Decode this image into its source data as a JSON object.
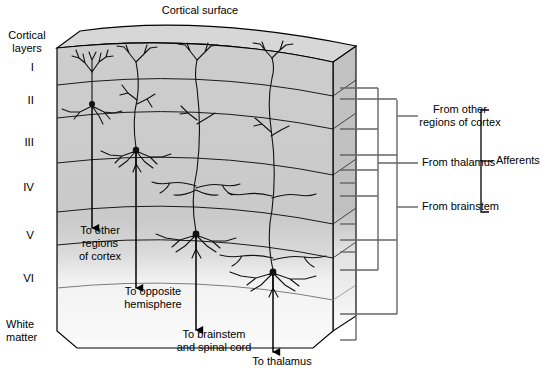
{
  "figure": {
    "title": "Cortical surface",
    "kind": "cortical-layers-3d-block-diagram"
  },
  "side_labels": {
    "cortical_layers": "Cortical\nlayers",
    "white_matter": "White\nmatter"
  },
  "layers": [
    {
      "id": "I",
      "label": "I"
    },
    {
      "id": "II",
      "label": "II"
    },
    {
      "id": "III",
      "label": "III"
    },
    {
      "id": "IV",
      "label": "IV"
    },
    {
      "id": "V",
      "label": "V"
    },
    {
      "id": "VI",
      "label": "VI"
    }
  ],
  "efferents": [
    {
      "id": "to-other-cortex",
      "text": "To other\nregions\nof cortex"
    },
    {
      "id": "to-opposite-hemisphere",
      "text": "To opposite\nhemisphere"
    },
    {
      "id": "to-brainstem-spinal-cord",
      "text": "To brainstem\nand spinal cord"
    },
    {
      "id": "to-thalamus",
      "text": "To thalamus"
    }
  ],
  "afferents": {
    "group_label": "Afferents",
    "items": [
      {
        "id": "from-other-cortex",
        "text": "From other\nregions of cortex"
      },
      {
        "id": "from-thalamus",
        "text": "From thalamus"
      },
      {
        "id": "from-brainstem",
        "text": "From brainstem"
      }
    ]
  },
  "colors": {
    "cortex_gray": "#cccccc",
    "top_face_gray": "#d9d9d9",
    "white_matter": "#f7f7f7",
    "outline": "#000000",
    "afferent_line": "#555555",
    "neuron": "#111111"
  }
}
